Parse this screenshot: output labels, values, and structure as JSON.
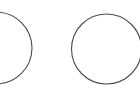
{
  "canvas": {
    "width": 140,
    "height": 96,
    "background_color": "#ffffff",
    "title": "Two outlined circles"
  },
  "style": {
    "stroke_color": "#4a4a52",
    "stroke_width": 1.1,
    "fill": "none"
  },
  "shapes": [
    {
      "id": "circle-left",
      "name": "left-circle",
      "type": "circle",
      "cx": -4,
      "cy": 48,
      "r": 36,
      "clipped": "left-edge",
      "stroke_color": "#4a4a52",
      "stroke_width": 1.1
    },
    {
      "id": "circle-right",
      "name": "right-circle",
      "type": "circle",
      "cx": 106.5,
      "cy": 49,
      "r": 35,
      "clipped": "none",
      "stroke_color": "#4a4a52",
      "stroke_width": 1.1
    }
  ]
}
